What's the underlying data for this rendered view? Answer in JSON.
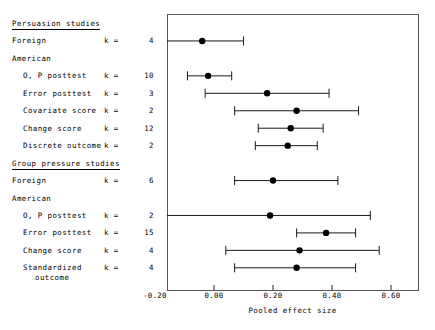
{
  "chart_data": {
    "type": "forest",
    "title": "",
    "xlabel": "Pooled effect size",
    "ylabel": "",
    "xlim": [
      -0.27,
      0.69
    ],
    "xticks": [
      -0.2,
      0.0,
      0.2,
      0.4,
      0.6
    ],
    "xticklabels": [
      "-0.20",
      "0.00",
      "0.20",
      "0.40",
      "0.60"
    ],
    "grid": false,
    "legend": null,
    "groups": [
      {
        "heading": "Persuasion studies",
        "rows": [
          {
            "label": "Foreign",
            "indent": false,
            "k_text": "k =",
            "k_value": "4",
            "effect": -0.04,
            "ci_low": -0.16,
            "ci_high": 0.1,
            "ci_low_clipped": true
          },
          {
            "label": "American",
            "indent": false,
            "k_text": "",
            "k_value": "",
            "effect": null,
            "ci_low": null,
            "ci_high": null
          },
          {
            "label": "O, P posttest",
            "indent": true,
            "k_text": "k =",
            "k_value": "10",
            "effect": -0.02,
            "ci_low": -0.09,
            "ci_high": 0.06
          },
          {
            "label": "Error posttest",
            "indent": true,
            "k_text": "k =",
            "k_value": "3",
            "effect": 0.18,
            "ci_low": -0.03,
            "ci_high": 0.39
          },
          {
            "label": "Covariate score",
            "indent": true,
            "k_text": "k =",
            "k_value": "2",
            "effect": 0.28,
            "ci_low": 0.07,
            "ci_high": 0.49
          },
          {
            "label": "Change score",
            "indent": true,
            "k_text": "k =",
            "k_value": "12",
            "effect": 0.26,
            "ci_low": 0.15,
            "ci_high": 0.37
          },
          {
            "label": "Discrete outcome",
            "indent": true,
            "k_text": "k =",
            "k_value": "2",
            "effect": 0.25,
            "ci_low": 0.14,
            "ci_high": 0.35
          }
        ]
      },
      {
        "heading": "Group pressure studies",
        "rows": [
          {
            "label": "Foreign",
            "indent": false,
            "k_text": "k =",
            "k_value": "6",
            "effect": 0.2,
            "ci_low": 0.07,
            "ci_high": 0.42
          },
          {
            "label": "American",
            "indent": false,
            "k_text": "",
            "k_value": "",
            "effect": null,
            "ci_low": null,
            "ci_high": null
          },
          {
            "label": "O, P posttest",
            "indent": true,
            "k_text": "k =",
            "k_value": "2",
            "effect": 0.19,
            "ci_low": -0.16,
            "ci_high": 0.53,
            "ci_low_clipped": true
          },
          {
            "label": "Error posttest",
            "indent": true,
            "k_text": "k =",
            "k_value": "15",
            "effect": 0.38,
            "ci_low": 0.28,
            "ci_high": 0.48
          },
          {
            "label": "Change score",
            "indent": true,
            "k_text": "k =",
            "k_value": "4",
            "effect": 0.29,
            "ci_low": 0.04,
            "ci_high": 0.56
          },
          {
            "label": "Standardized",
            "label_line2": "outcome",
            "indent": true,
            "k_text": "k =",
            "k_value": "4",
            "effect": 0.28,
            "ci_low": 0.07,
            "ci_high": 0.48
          }
        ]
      }
    ]
  },
  "style": {
    "frame_color": "#555555",
    "line_color": "#1a1a1a",
    "marker_color": "#000000",
    "background": "#ffffff"
  }
}
